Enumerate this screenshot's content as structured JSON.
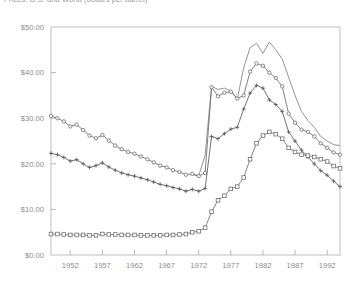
{
  "chart": {
    "title": "Prices, U.S. and World (dollars per barrel)",
    "title_visible_note": "clipped at top edge"
  },
  "chart_data": {
    "type": "line",
    "title": "Prices, U.S. and World (dollars per barrel)",
    "xlabel": "",
    "ylabel": "",
    "xlim": [
      1949,
      1994
    ],
    "ylim": [
      0,
      50
    ],
    "grid": false,
    "legend": "none",
    "y_ticks": [
      0,
      10,
      20,
      30,
      40,
      50
    ],
    "y_ticklabels": [
      "$0.00",
      "$10.00",
      "$20.00",
      "$30.00",
      "$40.00",
      "$50.00"
    ],
    "x_ticks": [
      1952,
      1957,
      1962,
      1967,
      1972,
      1977,
      1982,
      1987,
      1992
    ],
    "x_ticklabels": [
      "1952",
      "1957",
      "1962",
      "1967",
      "1972",
      "1977",
      "1982",
      "1987",
      "1992"
    ],
    "x": [
      1949,
      1950,
      1951,
      1952,
      1953,
      1954,
      1955,
      1956,
      1957,
      1958,
      1959,
      1960,
      1961,
      1962,
      1963,
      1964,
      1965,
      1966,
      1967,
      1968,
      1969,
      1970,
      1971,
      1972,
      1973,
      1974,
      1975,
      1976,
      1977,
      1978,
      1979,
      1980,
      1981,
      1982,
      1983,
      1984,
      1985,
      1986,
      1987,
      1988,
      1989,
      1990,
      1991,
      1992,
      1993,
      1994
    ],
    "series": [
      {
        "name": "series-plain-line",
        "marker": "none",
        "color": "#808080",
        "values": [
          null,
          null,
          null,
          null,
          null,
          null,
          null,
          null,
          null,
          null,
          null,
          null,
          null,
          null,
          null,
          null,
          null,
          null,
          null,
          null,
          null,
          null,
          17.6,
          17.4,
          21.8,
          37.0,
          36.3,
          36.6,
          36.0,
          34.2,
          41.0,
          45.5,
          46.4,
          44.2,
          46.7,
          45.0,
          43.0,
          39.0,
          35.0,
          31.5,
          29.5,
          28.0,
          26.0,
          25.0,
          24.2,
          24.0
        ]
      },
      {
        "name": "series-circle",
        "marker": "circle",
        "color": "#6b6b6b",
        "values": [
          30.5,
          30.0,
          29.3,
          28.2,
          28.6,
          27.4,
          26.2,
          25.6,
          26.3,
          25.1,
          24.0,
          23.2,
          22.6,
          22.2,
          21.6,
          21.0,
          20.3,
          19.6,
          19.2,
          18.6,
          18.2,
          17.6,
          17.8,
          17.3,
          18.0,
          36.8,
          34.8,
          35.6,
          35.8,
          34.3,
          35.0,
          40.2,
          42.0,
          41.5,
          40.0,
          38.8,
          37.0,
          31.0,
          29.0,
          27.5,
          27.0,
          26.0,
          24.5,
          23.5,
          22.5,
          22.0
        ]
      },
      {
        "name": "series-plus",
        "marker": "plus",
        "color": "#5a5a5a",
        "values": [
          22.3,
          22.0,
          21.4,
          20.6,
          20.9,
          20.0,
          19.2,
          19.6,
          20.2,
          19.3,
          18.6,
          18.0,
          17.6,
          17.3,
          16.9,
          16.5,
          16.0,
          15.5,
          15.2,
          14.8,
          14.5,
          14.0,
          14.4,
          14.0,
          14.6,
          26.0,
          25.5,
          26.6,
          27.6,
          28.0,
          32.0,
          35.5,
          37.2,
          36.6,
          34.0,
          33.0,
          31.5,
          27.0,
          25.0,
          23.0,
          21.5,
          20.0,
          18.5,
          17.5,
          16.2,
          15.0
        ]
      },
      {
        "name": "series-square",
        "marker": "square",
        "color": "#6f6f6f",
        "values": [
          4.6,
          4.6,
          4.5,
          4.4,
          4.4,
          4.4,
          4.3,
          4.3,
          4.6,
          4.5,
          4.5,
          4.4,
          4.4,
          4.4,
          4.3,
          4.3,
          4.3,
          4.3,
          4.4,
          4.4,
          4.5,
          4.6,
          5.0,
          5.2,
          6.0,
          9.5,
          12.0,
          13.0,
          14.5,
          15.0,
          17.0,
          21.0,
          24.5,
          26.2,
          27.0,
          26.5,
          25.5,
          23.5,
          22.6,
          22.0,
          21.8,
          21.5,
          21.0,
          20.5,
          19.5,
          19.0
        ]
      }
    ]
  }
}
